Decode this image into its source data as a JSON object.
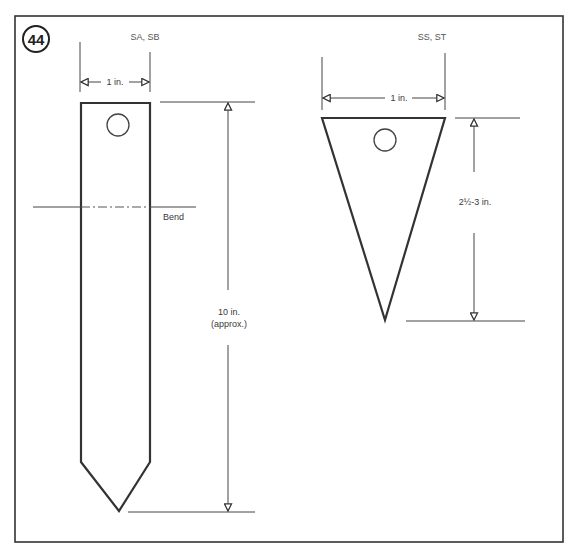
{
  "figure": {
    "number": "44",
    "border_color": "#333333",
    "line_color": "#333333",
    "background": "#ffffff"
  },
  "tag_left": {
    "caption": "SA, SB",
    "width_label": "1 in.",
    "bend_label": "Bend",
    "length_label_line1": "10 in.",
    "length_label_line2": "(approx.)"
  },
  "tag_right": {
    "caption": "SS, ST",
    "width_label": "1 in.",
    "length_label": "2½-3 in."
  }
}
